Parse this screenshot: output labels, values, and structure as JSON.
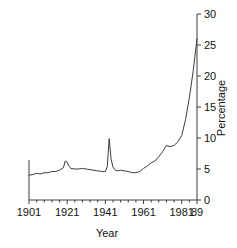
{
  "chart_data": {
    "type": "line",
    "title": "",
    "xlabel": "Year",
    "ylabel": "Percentage",
    "xlim": [
      1901,
      1989
    ],
    "ylim": [
      0,
      30
    ],
    "grid": false,
    "legend": null,
    "x_ticks": [
      1901,
      1921,
      1941,
      1961,
      1981,
      1989
    ],
    "x_tick_labels": [
      "1901",
      "1921",
      "1941",
      "1961",
      "1981",
      "89"
    ],
    "x_minor_tick_interval": 4,
    "y_ticks": [
      0,
      5,
      10,
      15,
      20,
      25,
      30
    ],
    "y_tick_labels": [
      "0",
      "5",
      "10",
      "15",
      "20",
      "25",
      "30"
    ],
    "y_axis_position": "right",
    "line_color": "#3c3c3c",
    "series": [
      {
        "name": "Percentage",
        "x": [
          1901,
          1903,
          1905,
          1907,
          1909,
          1911,
          1913,
          1915,
          1917,
          1919,
          1920,
          1921,
          1922,
          1923,
          1925,
          1927,
          1929,
          1931,
          1933,
          1935,
          1937,
          1939,
          1941,
          1942,
          1943,
          1944,
          1945,
          1946,
          1947,
          1949,
          1951,
          1953,
          1955,
          1957,
          1959,
          1961,
          1963,
          1965,
          1967,
          1969,
          1971,
          1973,
          1975,
          1977,
          1979,
          1981,
          1983,
          1985,
          1987,
          1989
        ],
        "values": [
          4.0,
          4.1,
          4.3,
          4.2,
          4.4,
          4.4,
          4.6,
          4.6,
          4.8,
          5.2,
          6.3,
          6.1,
          5.4,
          5.1,
          5.0,
          5.0,
          5.1,
          5.0,
          4.9,
          4.8,
          4.7,
          4.6,
          4.6,
          5.4,
          9.9,
          6.6,
          5.3,
          4.9,
          4.7,
          4.8,
          4.7,
          4.6,
          4.4,
          4.4,
          4.6,
          5.1,
          5.5,
          6.0,
          6.3,
          7.0,
          7.8,
          8.8,
          8.6,
          8.8,
          9.4,
          10.4,
          13.0,
          16.5,
          20.8,
          26.0
        ]
      }
    ]
  },
  "axis": {
    "x_label": "Year",
    "y_label": "Percentage"
  }
}
